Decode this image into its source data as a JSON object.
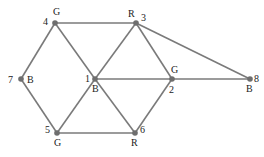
{
  "graph": {
    "nodes": [
      {
        "id": "1",
        "x": 95,
        "y": 79,
        "color": "B",
        "id_pos": [
          -10,
          3
        ],
        "color_pos": [
          -3,
          13
        ]
      },
      {
        "id": "2",
        "x": 172,
        "y": 79,
        "color": "G",
        "id_pos": [
          -3,
          14
        ],
        "color_pos": [
          -1,
          -6
        ]
      },
      {
        "id": "3",
        "x": 136,
        "y": 23,
        "color": "R",
        "id_pos": [
          5,
          -2
        ],
        "color_pos": [
          -8,
          -6
        ]
      },
      {
        "id": "4",
        "x": 55,
        "y": 23,
        "color": "G",
        "id_pos": [
          -12,
          2
        ],
        "color_pos": [
          -2,
          -8
        ]
      },
      {
        "id": "5",
        "x": 57,
        "y": 133,
        "color": "G",
        "id_pos": [
          -12,
          0
        ],
        "color_pos": [
          -3,
          13
        ]
      },
      {
        "id": "6",
        "x": 135,
        "y": 133,
        "color": "R",
        "id_pos": [
          5,
          0
        ],
        "color_pos": [
          -4,
          13
        ]
      },
      {
        "id": "7",
        "x": 21,
        "y": 79,
        "color": "B",
        "id_pos": [
          -13,
          4
        ],
        "color_pos": [
          6,
          4
        ]
      },
      {
        "id": "8",
        "x": 250,
        "y": 79,
        "color": "B",
        "id_pos": [
          4,
          3
        ],
        "color_pos": [
          -4,
          13
        ]
      }
    ],
    "edges": [
      [
        "4",
        "3"
      ],
      [
        "4",
        "7"
      ],
      [
        "4",
        "1"
      ],
      [
        "7",
        "5"
      ],
      [
        "1",
        "3"
      ],
      [
        "1",
        "2"
      ],
      [
        "1",
        "5"
      ],
      [
        "1",
        "6"
      ],
      [
        "3",
        "2"
      ],
      [
        "3",
        "8"
      ],
      [
        "2",
        "8"
      ],
      [
        "2",
        "6"
      ],
      [
        "5",
        "6"
      ]
    ]
  }
}
